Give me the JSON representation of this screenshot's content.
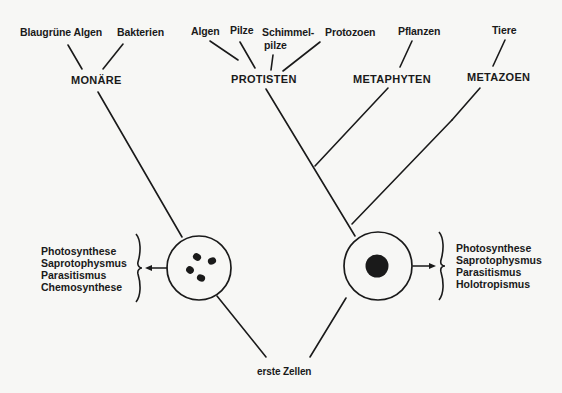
{
  "diagram": {
    "leaves": {
      "blaugruene_algen": "Blaugrüne Algen",
      "bakterien": "Bakterien",
      "algen": "Algen",
      "pilze": "Pilze",
      "schimmelpilze_1": "Schimmel-",
      "schimmelpilze_2": "pilze",
      "protozoen": "Protozoen",
      "pflanzen": "Pflanzen",
      "tiere": "Tiere"
    },
    "groups": {
      "monaere": "MONÄRE",
      "protisten": "PROTISTEN",
      "metaphyten": "METAPHYTEN",
      "metazoen": "METAZOEN"
    },
    "left_cell": {
      "type": "prokaryote",
      "nutrition": [
        "Photosynthese",
        "Saprotophysmus",
        "Parasitismus",
        "Chemosynthese"
      ]
    },
    "right_cell": {
      "type": "eukaryote",
      "nutrition": [
        "Photosynthese",
        "Saprotophysmus",
        "Parasitismus",
        "Holotropismus"
      ]
    },
    "root": "erste Zellen",
    "colors": {
      "ink": "#1a1a1a",
      "paper": "#f7f7f5"
    }
  }
}
